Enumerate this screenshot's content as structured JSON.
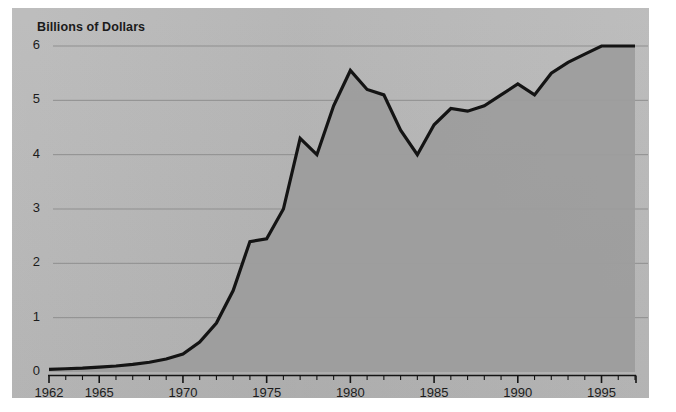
{
  "chart_data": {
    "type": "area",
    "title": "Billions of Dollars",
    "xlabel": "",
    "ylabel": "Billions of Dollars",
    "xlim": [
      1962,
      1997
    ],
    "ylim": [
      0,
      6
    ],
    "grid": true,
    "legend": false,
    "line_color": "#141414",
    "fill_color": "#9d9d9d",
    "panel_color": "#b6b6b6",
    "page_color": "#ffffff",
    "y_ticks": [
      0,
      1,
      2,
      3,
      4,
      5,
      6
    ],
    "y_tick_labels": [
      "0",
      "1",
      "2",
      "3",
      "4",
      "5",
      "6"
    ],
    "x_ticks": [
      1962,
      1963,
      1964,
      1965,
      1966,
      1967,
      1968,
      1969,
      1970,
      1971,
      1972,
      1973,
      1974,
      1975,
      1976,
      1977,
      1978,
      1979,
      1980,
      1981,
      1982,
      1983,
      1984,
      1985,
      1986,
      1987,
      1988,
      1989,
      1990,
      1991,
      1992,
      1993,
      1994,
      1995,
      1996,
      1997
    ],
    "x_tick_labels_shown": [
      "1962",
      "1965",
      "1970",
      "1975",
      "1980",
      "1985",
      "1990",
      "1995"
    ],
    "x_label_years": [
      1962,
      1965,
      1970,
      1975,
      1980,
      1985,
      1990,
      1995
    ],
    "x": [
      1962,
      1963,
      1964,
      1965,
      1966,
      1967,
      1968,
      1969,
      1970,
      1971,
      1972,
      1973,
      1974,
      1975,
      1976,
      1977,
      1978,
      1979,
      1980,
      1981,
      1982,
      1983,
      1984,
      1985,
      1986,
      1987,
      1988,
      1989,
      1990,
      1991,
      1992,
      1993,
      1994,
      1995,
      1996,
      1997
    ],
    "values": [
      0.05,
      0.06,
      0.07,
      0.09,
      0.11,
      0.14,
      0.18,
      0.24,
      0.33,
      0.55,
      0.9,
      1.5,
      2.4,
      2.45,
      3.0,
      4.3,
      4.0,
      4.9,
      5.55,
      5.2,
      5.1,
      4.45,
      4.0,
      4.55,
      4.85,
      4.8,
      4.9,
      5.1,
      5.3,
      5.1,
      5.5,
      5.7,
      5.85,
      6.0,
      6.0,
      6.0
    ]
  },
  "chart": {
    "title": "Billions of Dollars"
  }
}
